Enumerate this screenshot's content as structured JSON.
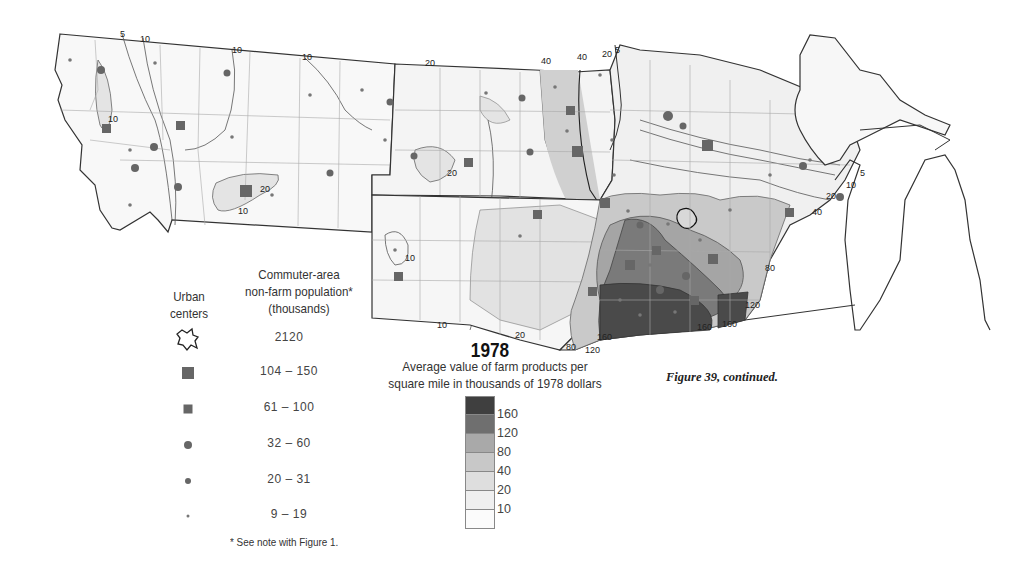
{
  "figure": {
    "year": "1978",
    "subtitle_line1": "Average value of farm products per",
    "subtitle_line2": "square mile in thousands of 1978 dollars",
    "caption": "Figure 39, continued."
  },
  "symbol_legend": {
    "header_urban_line1": "Urban",
    "header_urban_line2": "centers",
    "header_commuter_line1": "Commuter-area",
    "header_commuter_line2": "non-farm population*",
    "header_commuter_line3": "(thousands)",
    "items": [
      {
        "symbol": "urban-center-outline",
        "value": "2120"
      },
      {
        "symbol": "large-square",
        "value": "104 – 150"
      },
      {
        "symbol": "medium-square",
        "value": "61 – 100"
      },
      {
        "symbol": "large-circle",
        "value": "32 – 60"
      },
      {
        "symbol": "medium-circle",
        "value": "20 – 31"
      },
      {
        "symbol": "small-dot",
        "value": "9 – 19"
      }
    ],
    "footnote": "* See note with Figure 1."
  },
  "shading_scale": {
    "classes": [
      {
        "label": "",
        "color": "#3f3f3f"
      },
      {
        "label": "160",
        "color": "#6f6f6f"
      },
      {
        "label": "120",
        "color": "#a9a9a9"
      },
      {
        "label": "80",
        "color": "#c8c8c8"
      },
      {
        "label": "40",
        "color": "#dedede"
      },
      {
        "label": "20",
        "color": "#efefef"
      },
      {
        "label": "10",
        "color": "#fbfbfb"
      }
    ]
  },
  "map": {
    "contour_labels": [
      {
        "text": "5",
        "x": 120,
        "y": 37
      },
      {
        "text": "10",
        "x": 140,
        "y": 42
      },
      {
        "text": "10",
        "x": 232,
        "y": 53
      },
      {
        "text": "10",
        "x": 302,
        "y": 60
      },
      {
        "text": "10",
        "x": 108,
        "y": 122
      },
      {
        "text": "20",
        "x": 260,
        "y": 192
      },
      {
        "text": "10",
        "x": 238,
        "y": 214
      },
      {
        "text": "20",
        "x": 425,
        "y": 66
      },
      {
        "text": "20",
        "x": 447,
        "y": 176
      },
      {
        "text": "40",
        "x": 541,
        "y": 64
      },
      {
        "text": "40",
        "x": 577,
        "y": 60
      },
      {
        "text": "20",
        "x": 602,
        "y": 57
      },
      {
        "text": "5",
        "x": 615,
        "y": 53
      },
      {
        "text": "10",
        "x": 405,
        "y": 261
      },
      {
        "text": "10",
        "x": 437,
        "y": 328
      },
      {
        "text": "20",
        "x": 515,
        "y": 338
      },
      {
        "text": "80",
        "x": 566,
        "y": 350
      },
      {
        "text": "120",
        "x": 585,
        "y": 353
      },
      {
        "text": "160",
        "x": 597,
        "y": 340
      },
      {
        "text": "160",
        "x": 697,
        "y": 330
      },
      {
        "text": "160",
        "x": 722,
        "y": 327
      },
      {
        "text": "120",
        "x": 745,
        "y": 308
      },
      {
        "text": "80",
        "x": 765,
        "y": 271
      },
      {
        "text": "40",
        "x": 812,
        "y": 215
      },
      {
        "text": "20",
        "x": 826,
        "y": 199
      },
      {
        "text": "10",
        "x": 846,
        "y": 188
      },
      {
        "text": "5",
        "x": 860,
        "y": 176
      }
    ]
  }
}
